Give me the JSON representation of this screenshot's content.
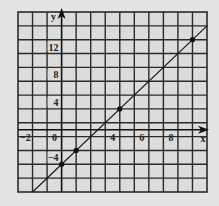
{
  "chart_data": {
    "type": "line",
    "title": "",
    "xlabel": "x",
    "ylabel": "y",
    "xlim": [
      -3,
      10
    ],
    "ylim": [
      -9,
      17
    ],
    "x_ticks": [
      -2,
      0,
      4,
      6,
      8
    ],
    "x_tick_labels": [
      "−2",
      "0",
      "4",
      "6",
      "8"
    ],
    "y_ticks": [
      12,
      8,
      4,
      -4
    ],
    "y_tick_labels": [
      "12",
      "8",
      "4",
      "−4"
    ],
    "grid": true,
    "grid_step_x": 1,
    "grid_step_y": 2,
    "series": [
      {
        "name": "y = 2x - 5",
        "line": {
          "slope": 2,
          "intercept": -5
        },
        "points": [
          {
            "x": 0,
            "y": -5
          },
          {
            "x": 1,
            "y": -3
          },
          {
            "x": 4,
            "y": 3
          },
          {
            "x": 9,
            "y": 13
          }
        ]
      }
    ],
    "colors": {
      "background": "#e4e4e4",
      "grid": "#2a2a2a",
      "line": "#1a1a1a"
    }
  }
}
